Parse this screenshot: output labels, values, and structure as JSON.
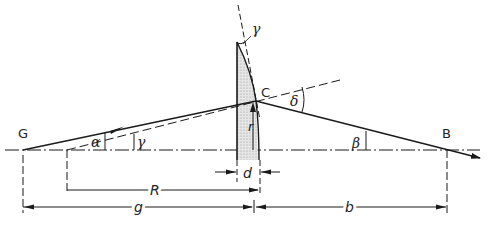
{
  "diagram": {
    "colors": {
      "line": "#1a1a1a",
      "lens_fill": "#d8d8d8",
      "background": "#ffffff"
    },
    "points": {
      "G": {
        "label": "G"
      },
      "B": {
        "label": "B"
      },
      "C": {
        "label": "C"
      }
    },
    "angles": {
      "alpha": "α",
      "gamma_lower": "γ",
      "gamma_upper": "γ",
      "delta": "δ",
      "beta": "β"
    },
    "dimensions": {
      "R": "R",
      "d": "d",
      "g": "g",
      "b": "b",
      "r": "r"
    }
  }
}
